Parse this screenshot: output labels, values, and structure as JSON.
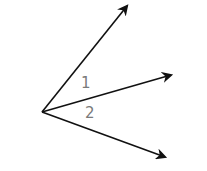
{
  "diagram": {
    "type": "adjacent-angles",
    "vertex": {
      "x": 42,
      "y": 112
    },
    "rays": [
      {
        "name": "upper-ray",
        "end": {
          "x": 127,
          "y": 6
        }
      },
      {
        "name": "middle-ray",
        "end": {
          "x": 171,
          "y": 75
        }
      },
      {
        "name": "lower-ray",
        "end": {
          "x": 165,
          "y": 157
        }
      }
    ],
    "labels": [
      {
        "name": "angle-1-label",
        "text": "1",
        "x": 81,
        "y": 88
      },
      {
        "name": "angle-2-label",
        "text": "2",
        "x": 85,
        "y": 118
      }
    ],
    "colors": {
      "ray": "#111111",
      "label": "#7a7a7a",
      "background": "#ffffff"
    }
  }
}
